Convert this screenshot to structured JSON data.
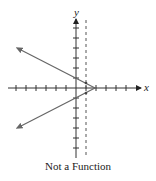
{
  "figure": {
    "x_label": "x",
    "y_label": "y",
    "caption": "Not a Function"
  },
  "colors": {
    "axis": "#333333",
    "curve": "#666666",
    "dashed": "#555555"
  },
  "geometry": {
    "origin": [
      76,
      88
    ],
    "tick_spacing": 10,
    "dashed_line_x": 86,
    "vertex": [
      95,
      88
    ],
    "upper_ray_end": [
      19,
      49
    ],
    "lower_ray_end": [
      19,
      127
    ]
  }
}
